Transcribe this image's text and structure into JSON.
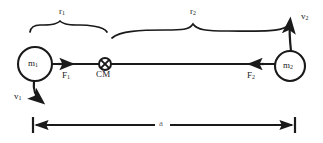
{
  "figure": {
    "background_color": "#ffffff",
    "ink_color": "#1a1a1a"
  },
  "bodies": [
    {
      "id": "m1",
      "label_text": "m",
      "label_sub": "1",
      "cx": 35,
      "cy": 64,
      "r": 17
    },
    {
      "id": "m2",
      "label_text": "m",
      "label_sub": "2",
      "cx": 290,
      "cy": 66,
      "r": 15
    }
  ],
  "center_of_mass": {
    "symbol": "circle-cross",
    "label": "CM",
    "cx": 105,
    "cy": 64,
    "r": 6
  },
  "forces": [
    {
      "id": "F1",
      "label_text": "F",
      "label_sub": "1",
      "direction": "right",
      "tip_x": 73,
      "y": 64
    },
    {
      "id": "F2",
      "label_text": "F",
      "label_sub": "2",
      "direction": "left",
      "tip_x": 249,
      "y": 64
    }
  ],
  "velocities": [
    {
      "id": "v1",
      "label_text": "v",
      "label_sub": "1",
      "direction": "down-curved",
      "label_x": 14,
      "label_y": 92
    },
    {
      "id": "v2",
      "label_text": "v",
      "label_sub": "2",
      "direction": "up-curved",
      "label_x": 301,
      "label_y": 12
    }
  ],
  "radii": [
    {
      "id": "r1",
      "label_text": "r",
      "label_sub": "1",
      "brace_left": 30,
      "brace_right": 107,
      "label_x": 63,
      "label_y": 8
    },
    {
      "id": "r2",
      "label_text": "r",
      "label_sub": "2",
      "brace_left": 112,
      "brace_right": 286,
      "label_x": 193,
      "label_y": 8
    }
  ],
  "dimension": {
    "id": "a",
    "label": "a",
    "left_x": 33,
    "right_x": 295,
    "y": 125,
    "label_x": 161,
    "label_y": 120
  },
  "connector": {
    "from_x": 52,
    "to_x": 275,
    "y": 64
  }
}
